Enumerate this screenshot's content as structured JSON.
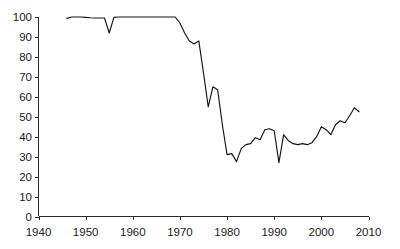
{
  "chart_data": {
    "type": "line",
    "title": "",
    "subtitle": "",
    "xlabel": "",
    "ylabel": "",
    "xlim": [
      1940,
      2010
    ],
    "ylim": [
      0,
      100
    ],
    "grid": false,
    "legend": "none",
    "x_ticks": [
      1940,
      1950,
      1960,
      1970,
      1980,
      1990,
      2000,
      2010
    ],
    "x_tick_labels": [
      "1940",
      "1950",
      "1960",
      "1970",
      "1980",
      "1990",
      "2000",
      "2010"
    ],
    "y_ticks": [
      0,
      10,
      20,
      30,
      40,
      50,
      60,
      70,
      80,
      90,
      100
    ],
    "y_tick_labels": [
      "0",
      "10",
      "20",
      "30",
      "40",
      "50",
      "60",
      "70",
      "80",
      "90",
      "100"
    ],
    "series": [
      {
        "name": "series-1",
        "color": "#141414",
        "x": [
          1946,
          1947,
          1948,
          1949,
          1950,
          1951,
          1952,
          1953,
          1954,
          1955,
          1956,
          1957,
          1958,
          1959,
          1960,
          1961,
          1962,
          1963,
          1964,
          1965,
          1966,
          1967,
          1968,
          1969,
          1970,
          1971,
          1972,
          1973,
          1974,
          1975,
          1976,
          1977,
          1978,
          1979,
          1980,
          1981,
          1982,
          1983,
          1984,
          1985,
          1986,
          1987,
          1988,
          1989,
          1990,
          1991,
          1992,
          1993,
          1994,
          1995,
          1996,
          1997,
          1998,
          1999,
          2000,
          2001,
          2002,
          2003,
          2004,
          2005,
          2006,
          2007,
          2008
        ],
        "values": [
          99.3,
          100.0,
          100.0,
          100.0,
          99.8,
          99.6,
          99.5,
          99.5,
          99.5,
          92.0,
          99.8,
          100.0,
          100.0,
          100.0,
          100.0,
          100.0,
          100.0,
          100.0,
          100.0,
          100.0,
          100.0,
          100.0,
          100.0,
          100.0,
          97.0,
          92.0,
          88.0,
          86.5,
          88.0,
          72.0,
          55.0,
          65.0,
          63.5,
          46.0,
          31.0,
          31.5,
          27.5,
          34.0,
          36.0,
          36.5,
          39.5,
          38.5,
          43.5,
          44.0,
          43.0,
          27.0,
          41.0,
          38.0,
          36.5,
          36.0,
          36.5,
          36.0,
          37.0,
          40.0,
          45.0,
          43.5,
          41.0,
          46.0,
          48.0,
          47.0,
          50.5,
          54.5,
          52.5
        ]
      }
    ]
  },
  "axes": {
    "x_axis_name": "x-axis",
    "y_axis_name": "y-axis"
  }
}
